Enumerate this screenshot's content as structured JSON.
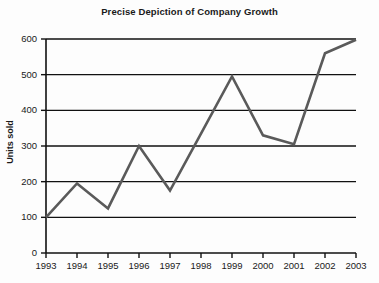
{
  "chart_data": {
    "type": "line",
    "title": "Precise Depiction of Company Growth",
    "xlabel": "",
    "ylabel": "Units sold",
    "categories": [
      "1993",
      "1994",
      "1995",
      "1996",
      "1997",
      "1998",
      "1999",
      "2000",
      "2001",
      "2002",
      "2003"
    ],
    "values": [
      100,
      195,
      125,
      300,
      175,
      335,
      495,
      330,
      305,
      560,
      598
    ],
    "series": [
      {
        "name": "Units sold",
        "values": [
          100,
          195,
          125,
          300,
          175,
          335,
          495,
          330,
          305,
          560,
          598
        ]
      }
    ],
    "ylim": [
      0,
      600
    ],
    "yticks": [
      0,
      100,
      200,
      300,
      400,
      500,
      600
    ],
    "ytick_labels": [
      "0",
      "100",
      "200",
      "300",
      "400",
      "500",
      "600"
    ],
    "xtick_labels": [
      "1993",
      "1994",
      "1995",
      "1996",
      "1997",
      "1998",
      "1999",
      "2000",
      "2001",
      "2002",
      "2003"
    ],
    "grid": "horizontal",
    "legend": "none",
    "colors": {
      "line": "#5a5a5a",
      "grid": "#111111",
      "axis": "#111111",
      "text": "#1a1a1a",
      "background": "#fdfdfd"
    },
    "line_width": 2.6
  },
  "axes": {
    "y_axis_title": "Units sold"
  }
}
